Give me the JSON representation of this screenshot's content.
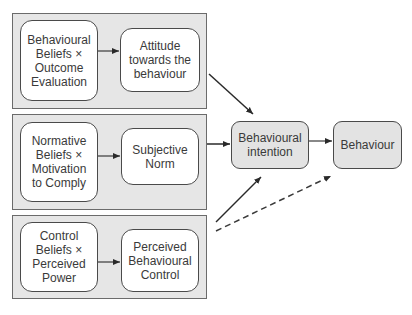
{
  "diagram": {
    "panels": [
      {
        "id": "attitude-panel",
        "left_box": "Behavioural\nBeliefs ×\nOutcome\nEvaluation",
        "right_box": "Attitude\ntowards the\nbehaviour"
      },
      {
        "id": "norm-panel",
        "left_box": "Normative\nBeliefs ×\nMotivation\nto Comply",
        "right_box": "Subjective\nNorm"
      },
      {
        "id": "control-panel",
        "left_box": "Control\nBeliefs ×\nPerceived\nPower",
        "right_box": "Perceived\nBehavioural\nControl"
      }
    ],
    "intention_box": "Behavioural\nintention",
    "behaviour_box": "Behaviour",
    "edges": [
      {
        "from": "Behavioural Beliefs × Outcome Evaluation",
        "to": "Attitude towards the behaviour",
        "style": "solid"
      },
      {
        "from": "Normative Beliefs × Motivation to Comply",
        "to": "Subjective Norm",
        "style": "solid"
      },
      {
        "from": "Control Beliefs × Perceived Power",
        "to": "Perceived Behavioural Control",
        "style": "solid"
      },
      {
        "from": "Attitude towards the behaviour",
        "to": "Behavioural intention",
        "style": "solid"
      },
      {
        "from": "Subjective Norm",
        "to": "Behavioural intention",
        "style": "solid"
      },
      {
        "from": "Perceived Behavioural Control",
        "to": "Behavioural intention",
        "style": "solid"
      },
      {
        "from": "Behavioural intention",
        "to": "Behaviour",
        "style": "solid"
      },
      {
        "from": "Perceived Behavioural Control",
        "to": "Behaviour",
        "style": "dashed"
      }
    ],
    "colors": {
      "panel_fill": "#e6e6e6",
      "box_fill": "#ffffff",
      "outcome_fill": "#e3e3e3",
      "stroke": "#4a4a4a"
    }
  }
}
